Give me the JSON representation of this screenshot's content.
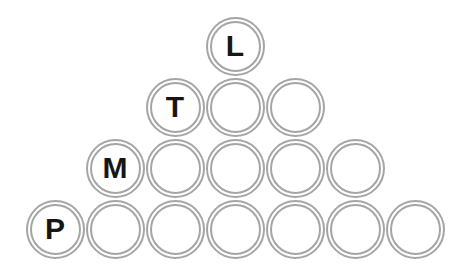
{
  "figure": {
    "type": "circle-pyramid-diagram",
    "background_color": "#ffffff",
    "ring_color": "#a5a5a5",
    "letter_color": "#161616",
    "pyramid": {
      "rows": [
        {
          "label": "L",
          "count": 1
        },
        {
          "label": "T",
          "count": 3
        },
        {
          "label": "M",
          "count": 5
        },
        {
          "label": "P",
          "count": 7
        }
      ],
      "labeled_position_in_row": "first"
    }
  }
}
